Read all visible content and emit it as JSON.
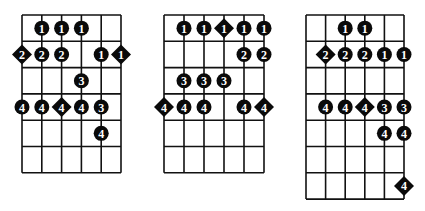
{
  "diagrams": [
    {
      "name": "scale-pattern-1",
      "x": 22,
      "y": 15,
      "string_spacing": 19.8,
      "fret_spacing": 26.3,
      "strings": 6,
      "frets": 6,
      "notes": [
        {
          "string": 1,
          "fret": 1,
          "finger": "1",
          "shape": "circle"
        },
        {
          "string": 2,
          "fret": 1,
          "finger": "1",
          "shape": "circle"
        },
        {
          "string": 3,
          "fret": 1,
          "finger": "1",
          "shape": "circle"
        },
        {
          "string": 0,
          "fret": 2,
          "finger": "2",
          "shape": "diamond"
        },
        {
          "string": 1,
          "fret": 2,
          "finger": "2",
          "shape": "circle"
        },
        {
          "string": 2,
          "fret": 2,
          "finger": "2",
          "shape": "circle"
        },
        {
          "string": 4,
          "fret": 2,
          "finger": "1",
          "shape": "circle"
        },
        {
          "string": 5,
          "fret": 2,
          "finger": "1",
          "shape": "diamond"
        },
        {
          "string": 3,
          "fret": 3,
          "finger": "3",
          "shape": "circle"
        },
        {
          "string": 0,
          "fret": 4,
          "finger": "4",
          "shape": "circle"
        },
        {
          "string": 1,
          "fret": 4,
          "finger": "4",
          "shape": "circle"
        },
        {
          "string": 2,
          "fret": 4,
          "finger": "4",
          "shape": "diamond"
        },
        {
          "string": 3,
          "fret": 4,
          "finger": "4",
          "shape": "circle"
        },
        {
          "string": 4,
          "fret": 4,
          "finger": "3",
          "shape": "circle"
        },
        {
          "string": 4,
          "fret": 5,
          "finger": "4",
          "shape": "circle"
        }
      ]
    },
    {
      "name": "scale-pattern-2",
      "x": 164,
      "y": 15,
      "string_spacing": 20,
      "fret_spacing": 26.3,
      "strings": 6,
      "frets": 6,
      "notes": [
        {
          "string": 1,
          "fret": 1,
          "finger": "1",
          "shape": "circle"
        },
        {
          "string": 2,
          "fret": 1,
          "finger": "1",
          "shape": "circle"
        },
        {
          "string": 3,
          "fret": 1,
          "finger": "1",
          "shape": "diamond"
        },
        {
          "string": 4,
          "fret": 1,
          "finger": "1",
          "shape": "circle"
        },
        {
          "string": 5,
          "fret": 1,
          "finger": "1",
          "shape": "circle"
        },
        {
          "string": 4,
          "fret": 2,
          "finger": "2",
          "shape": "circle"
        },
        {
          "string": 5,
          "fret": 2,
          "finger": "2",
          "shape": "circle"
        },
        {
          "string": 1,
          "fret": 3,
          "finger": "3",
          "shape": "circle"
        },
        {
          "string": 2,
          "fret": 3,
          "finger": "3",
          "shape": "circle"
        },
        {
          "string": 3,
          "fret": 3,
          "finger": "3",
          "shape": "circle"
        },
        {
          "string": 0,
          "fret": 4,
          "finger": "4",
          "shape": "diamond"
        },
        {
          "string": 1,
          "fret": 4,
          "finger": "4",
          "shape": "circle"
        },
        {
          "string": 2,
          "fret": 4,
          "finger": "4",
          "shape": "circle"
        },
        {
          "string": 4,
          "fret": 4,
          "finger": "4",
          "shape": "circle"
        },
        {
          "string": 5,
          "fret": 4,
          "finger": "4",
          "shape": "diamond"
        }
      ]
    },
    {
      "name": "scale-pattern-3",
      "x": 306,
      "y": 15,
      "string_spacing": 19.6,
      "fret_spacing": 26.3,
      "strings": 6,
      "frets": 7,
      "notes": [
        {
          "string": 2,
          "fret": 1,
          "finger": "1",
          "shape": "circle"
        },
        {
          "string": 3,
          "fret": 1,
          "finger": "1",
          "shape": "circle"
        },
        {
          "string": 1,
          "fret": 2,
          "finger": "2",
          "shape": "diamond"
        },
        {
          "string": 2,
          "fret": 2,
          "finger": "2",
          "shape": "circle"
        },
        {
          "string": 3,
          "fret": 2,
          "finger": "2",
          "shape": "circle"
        },
        {
          "string": 4,
          "fret": 2,
          "finger": "1",
          "shape": "circle"
        },
        {
          "string": 5,
          "fret": 2,
          "finger": "1",
          "shape": "circle"
        },
        {
          "string": 1,
          "fret": 4,
          "finger": "4",
          "shape": "circle"
        },
        {
          "string": 2,
          "fret": 4,
          "finger": "4",
          "shape": "circle"
        },
        {
          "string": 3,
          "fret": 4,
          "finger": "4",
          "shape": "diamond"
        },
        {
          "string": 4,
          "fret": 4,
          "finger": "3",
          "shape": "circle"
        },
        {
          "string": 5,
          "fret": 4,
          "finger": "3",
          "shape": "circle"
        },
        {
          "string": 4,
          "fret": 5,
          "finger": "4",
          "shape": "circle"
        },
        {
          "string": 5,
          "fret": 5,
          "finger": "4",
          "shape": "circle"
        },
        {
          "string": 5,
          "fret": 7,
          "finger": "4",
          "shape": "diamond"
        }
      ]
    }
  ]
}
